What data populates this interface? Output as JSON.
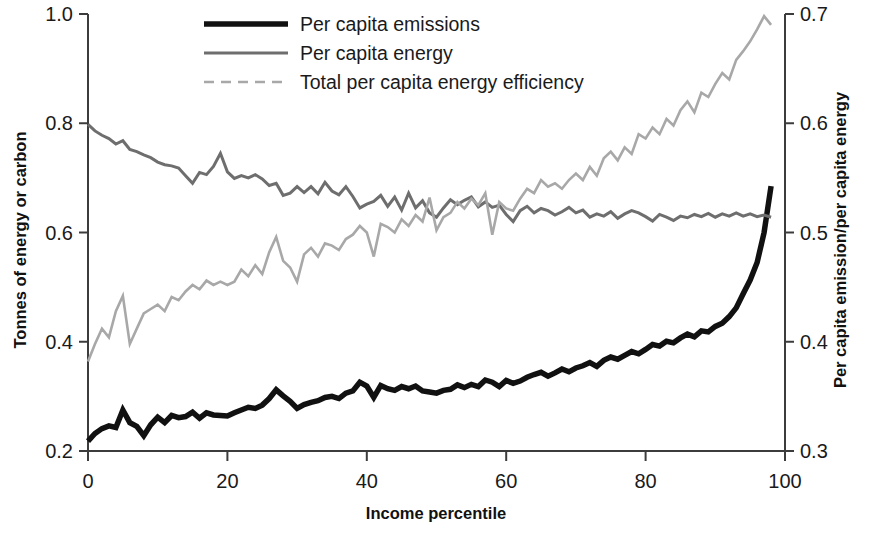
{
  "chart_data": {
    "type": "line",
    "title": "",
    "xlabel": "Income percentile",
    "ylabel": "Tonnes of energy or carbon",
    "ylabel_right": "Per capita emission/per capita energy",
    "xlim": [
      0,
      100
    ],
    "ylim": [
      0.2,
      1.0
    ],
    "ylim_right": [
      0.3,
      0.7
    ],
    "xticks": [
      0,
      20,
      40,
      60,
      80,
      100
    ],
    "xtick_labels": [
      "0",
      "20",
      "40",
      "60",
      "80",
      "100"
    ],
    "yticks": [
      0.2,
      0.4,
      0.6,
      0.8,
      1.0
    ],
    "ytick_labels": [
      "0.2",
      "0.4",
      "0.6",
      "0.8",
      "1.0"
    ],
    "yticks_right": [
      0.3,
      0.4,
      0.5,
      0.6,
      0.7
    ],
    "ytick_labels_right": [
      "0.3",
      "0.4",
      "0.5",
      "0.6",
      "0.7"
    ],
    "grid": false,
    "legend_position": "top-center",
    "legend": [
      {
        "label": "Per capita emissions",
        "color": "#111111",
        "width": 5.5,
        "dash": "none",
        "axis": "left"
      },
      {
        "label": "Per capita energy",
        "color": "#6e6e6e",
        "width": 3.0,
        "dash": "none",
        "axis": "left"
      },
      {
        "label": "Total per capita energy efficiency",
        "color": "#a8a8a8",
        "width": 2.6,
        "dash": "10,7",
        "axis": "right"
      }
    ],
    "x": [
      0,
      1,
      2,
      3,
      4,
      5,
      6,
      7,
      8,
      9,
      10,
      11,
      12,
      13,
      14,
      15,
      16,
      17,
      18,
      19,
      20,
      21,
      22,
      23,
      24,
      25,
      26,
      27,
      28,
      29,
      30,
      31,
      32,
      33,
      34,
      35,
      36,
      37,
      38,
      39,
      40,
      41,
      42,
      43,
      44,
      45,
      46,
      47,
      48,
      49,
      50,
      51,
      52,
      53,
      54,
      55,
      56,
      57,
      58,
      59,
      60,
      61,
      62,
      63,
      64,
      65,
      66,
      67,
      68,
      69,
      70,
      71,
      72,
      73,
      74,
      75,
      76,
      77,
      78,
      79,
      80,
      81,
      82,
      83,
      84,
      85,
      86,
      87,
      88,
      89,
      90,
      91,
      92,
      93,
      94,
      95,
      96,
      97,
      98
    ],
    "series": [
      {
        "name": "Per capita emissions",
        "axis": "left",
        "color": "#111111",
        "values": [
          0.218,
          0.232,
          0.241,
          0.246,
          0.243,
          0.275,
          0.252,
          0.245,
          0.228,
          0.248,
          0.262,
          0.252,
          0.265,
          0.261,
          0.263,
          0.271,
          0.26,
          0.27,
          0.266,
          0.265,
          0.264,
          0.27,
          0.275,
          0.28,
          0.278,
          0.284,
          0.296,
          0.312,
          0.301,
          0.291,
          0.278,
          0.285,
          0.289,
          0.292,
          0.298,
          0.3,
          0.296,
          0.306,
          0.31,
          0.326,
          0.319,
          0.298,
          0.32,
          0.314,
          0.311,
          0.318,
          0.314,
          0.319,
          0.31,
          0.308,
          0.306,
          0.311,
          0.313,
          0.321,
          0.316,
          0.322,
          0.318,
          0.33,
          0.326,
          0.318,
          0.329,
          0.324,
          0.328,
          0.335,
          0.34,
          0.344,
          0.337,
          0.343,
          0.35,
          0.345,
          0.352,
          0.356,
          0.362,
          0.355,
          0.366,
          0.372,
          0.368,
          0.375,
          0.382,
          0.378,
          0.386,
          0.395,
          0.392,
          0.401,
          0.398,
          0.407,
          0.414,
          0.409,
          0.42,
          0.418,
          0.428,
          0.434,
          0.446,
          0.462,
          0.488,
          0.513,
          0.545,
          0.6,
          0.685
        ]
      },
      {
        "name": "Per capita energy",
        "axis": "left",
        "color": "#6e6e6e",
        "values": [
          0.798,
          0.786,
          0.778,
          0.772,
          0.762,
          0.768,
          0.752,
          0.748,
          0.742,
          0.737,
          0.729,
          0.724,
          0.722,
          0.718,
          0.704,
          0.69,
          0.71,
          0.706,
          0.721,
          0.745,
          0.711,
          0.699,
          0.704,
          0.7,
          0.706,
          0.698,
          0.686,
          0.69,
          0.668,
          0.672,
          0.684,
          0.673,
          0.684,
          0.671,
          0.692,
          0.676,
          0.669,
          0.684,
          0.666,
          0.645,
          0.652,
          0.657,
          0.668,
          0.648,
          0.665,
          0.641,
          0.672,
          0.645,
          0.658,
          0.636,
          0.628,
          0.645,
          0.66,
          0.651,
          0.659,
          0.665,
          0.647,
          0.656,
          0.646,
          0.65,
          0.633,
          0.62,
          0.64,
          0.648,
          0.636,
          0.644,
          0.64,
          0.632,
          0.638,
          0.646,
          0.636,
          0.641,
          0.628,
          0.634,
          0.63,
          0.638,
          0.626,
          0.634,
          0.64,
          0.636,
          0.629,
          0.621,
          0.633,
          0.628,
          0.622,
          0.63,
          0.627,
          0.633,
          0.629,
          0.635,
          0.628,
          0.634,
          0.63,
          0.636,
          0.63,
          0.634,
          0.629,
          0.632,
          0.628
        ]
      },
      {
        "name": "Total per capita energy efficiency",
        "axis": "right",
        "color": "#a8a8a8",
        "values": [
          0.382,
          0.398,
          0.412,
          0.404,
          0.428,
          0.442,
          0.398,
          0.412,
          0.426,
          0.43,
          0.434,
          0.428,
          0.441,
          0.438,
          0.446,
          0.452,
          0.448,
          0.456,
          0.452,
          0.455,
          0.452,
          0.455,
          0.466,
          0.46,
          0.47,
          0.462,
          0.482,
          0.496,
          0.474,
          0.468,
          0.455,
          0.48,
          0.486,
          0.478,
          0.49,
          0.488,
          0.484,
          0.494,
          0.498,
          0.506,
          0.5,
          0.478,
          0.508,
          0.505,
          0.5,
          0.512,
          0.506,
          0.516,
          0.51,
          0.532,
          0.502,
          0.514,
          0.518,
          0.528,
          0.522,
          0.531,
          0.525,
          0.536,
          0.498,
          0.528,
          0.522,
          0.52,
          0.531,
          0.54,
          0.536,
          0.548,
          0.542,
          0.545,
          0.54,
          0.548,
          0.554,
          0.548,
          0.56,
          0.552,
          0.568,
          0.574,
          0.566,
          0.578,
          0.572,
          0.59,
          0.586,
          0.596,
          0.59,
          0.604,
          0.598,
          0.612,
          0.62,
          0.61,
          0.628,
          0.624,
          0.636,
          0.646,
          0.64,
          0.658,
          0.666,
          0.675,
          0.686,
          0.698,
          0.69
        ]
      }
    ]
  },
  "axes": {
    "left_title": "Tonnes of energy or carbon",
    "right_title": "Per capita emission/per capita energy",
    "bottom_title": "Income percentile"
  }
}
